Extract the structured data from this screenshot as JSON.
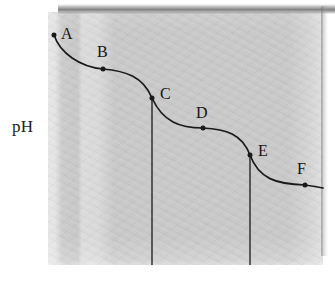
{
  "figure": {
    "name": "ph-titration-curve",
    "y_axis_label": "pH",
    "background_color": "#ffffff",
    "panel_color": "#c9c9c9",
    "curve_color": "#1a1a1a"
  },
  "chart_data": {
    "type": "line",
    "title": "",
    "xlabel": "",
    "ylabel": "pH",
    "grid": false,
    "legend": null,
    "axis_ticks": {
      "x": [],
      "y": []
    },
    "series": [
      {
        "name": "titration curve",
        "description": "Stepwise descending polyprotic titration curve with three plateaus and two sharp equivalence-point drops",
        "annotated_points": [
          {
            "label": "A",
            "x": 54,
            "y": 35
          },
          {
            "label": "B",
            "x": 103,
            "y": 69
          },
          {
            "label": "C",
            "x": 152,
            "y": 98
          },
          {
            "label": "D",
            "x": 203,
            "y": 128
          },
          {
            "label": "E",
            "x": 250,
            "y": 155
          },
          {
            "label": "F",
            "x": 305,
            "y": 185
          }
        ]
      }
    ],
    "equivalence_drop_lines": [
      {
        "x": 152,
        "y_top": 100,
        "y_bottom": 265
      },
      {
        "x": 250,
        "y_top": 157,
        "y_bottom": 265
      }
    ]
  },
  "labels": {
    "A": "A",
    "B": "B",
    "C": "C",
    "D": "D",
    "E": "E",
    "F": "F"
  },
  "label_positions": {
    "A": {
      "left": 61,
      "top": 26
    },
    "B": {
      "left": 97,
      "top": 44
    },
    "C": {
      "left": 160,
      "top": 86
    },
    "D": {
      "left": 196,
      "top": 105
    },
    "E": {
      "left": 258,
      "top": 143
    },
    "F": {
      "left": 297,
      "top": 161
    }
  }
}
